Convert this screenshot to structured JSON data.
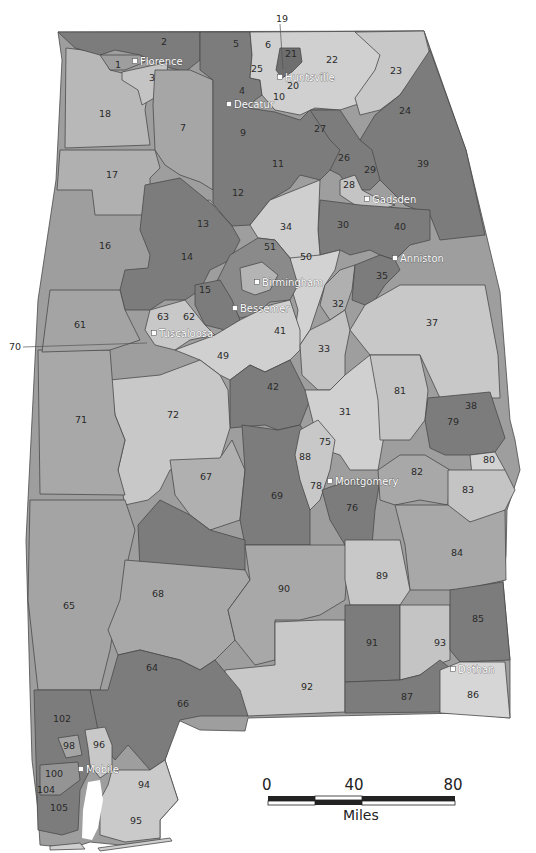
{
  "map": {
    "subject": "Alabama State House Districts",
    "colors": {
      "dark": "#7c7c7c",
      "medium": "#9e9e9e",
      "light": "#c4c4c4",
      "lighter": "#d6d6d6",
      "border": "#4a4a4a",
      "background": "#ffffff"
    },
    "cities": [
      {
        "name": "Florence",
        "x": 135,
        "y": 61
      },
      {
        "name": "Huntsville",
        "x": 280,
        "y": 77
      },
      {
        "name": "Decatur",
        "x": 229,
        "y": 104
      },
      {
        "name": "Gadsden",
        "x": 367,
        "y": 199
      },
      {
        "name": "Anniston",
        "x": 395,
        "y": 258
      },
      {
        "name": "Birmingham",
        "x": 257,
        "y": 282
      },
      {
        "name": "Bessemer",
        "x": 235,
        "y": 308
      },
      {
        "name": "Tuscaloosa",
        "x": 154,
        "y": 333
      },
      {
        "name": "Montgomery",
        "x": 330,
        "y": 481
      },
      {
        "name": "Dothan",
        "x": 453,
        "y": 669
      },
      {
        "name": "Mobile",
        "x": 81,
        "y": 769
      }
    ],
    "districts": [
      {
        "n": "1",
        "x": 118,
        "y": 65
      },
      {
        "n": "2",
        "x": 164,
        "y": 42
      },
      {
        "n": "3",
        "x": 152,
        "y": 78
      },
      {
        "n": "4",
        "x": 242,
        "y": 91
      },
      {
        "n": "5",
        "x": 236,
        "y": 44
      },
      {
        "n": "6",
        "x": 268,
        "y": 45
      },
      {
        "n": "7",
        "x": 183,
        "y": 128
      },
      {
        "n": "9",
        "x": 243,
        "y": 133
      },
      {
        "n": "10",
        "x": 279,
        "y": 97
      },
      {
        "n": "11",
        "x": 278,
        "y": 164
      },
      {
        "n": "12",
        "x": 238,
        "y": 193
      },
      {
        "n": "13",
        "x": 203,
        "y": 224
      },
      {
        "n": "14",
        "x": 187,
        "y": 257
      },
      {
        "n": "15",
        "x": 205,
        "y": 290
      },
      {
        "n": "16",
        "x": 105,
        "y": 246
      },
      {
        "n": "17",
        "x": 112,
        "y": 175
      },
      {
        "n": "18",
        "x": 105,
        "y": 114
      },
      {
        "n": "20",
        "x": 293,
        "y": 86
      },
      {
        "n": "21",
        "x": 291,
        "y": 54
      },
      {
        "n": "22",
        "x": 332,
        "y": 60
      },
      {
        "n": "23",
        "x": 396,
        "y": 71
      },
      {
        "n": "24",
        "x": 405,
        "y": 111
      },
      {
        "n": "25",
        "x": 257,
        "y": 69
      },
      {
        "n": "26",
        "x": 344,
        "y": 158
      },
      {
        "n": "27",
        "x": 320,
        "y": 129
      },
      {
        "n": "28",
        "x": 349,
        "y": 185
      },
      {
        "n": "29",
        "x": 370,
        "y": 170
      },
      {
        "n": "30",
        "x": 343,
        "y": 225
      },
      {
        "n": "31",
        "x": 345,
        "y": 412
      },
      {
        "n": "32",
        "x": 338,
        "y": 304
      },
      {
        "n": "33",
        "x": 324,
        "y": 349
      },
      {
        "n": "34",
        "x": 286,
        "y": 227
      },
      {
        "n": "35",
        "x": 382,
        "y": 276
      },
      {
        "n": "37",
        "x": 432,
        "y": 323
      },
      {
        "n": "38",
        "x": 471,
        "y": 406
      },
      {
        "n": "39",
        "x": 423,
        "y": 164
      },
      {
        "n": "40",
        "x": 400,
        "y": 227
      },
      {
        "n": "41",
        "x": 280,
        "y": 331
      },
      {
        "n": "42",
        "x": 273,
        "y": 387
      },
      {
        "n": "49",
        "x": 223,
        "y": 356
      },
      {
        "n": "50",
        "x": 306,
        "y": 257
      },
      {
        "n": "51",
        "x": 270,
        "y": 247
      },
      {
        "n": "61",
        "x": 80,
        "y": 325
      },
      {
        "n": "62",
        "x": 189,
        "y": 317
      },
      {
        "n": "63",
        "x": 163,
        "y": 317
      },
      {
        "n": "64",
        "x": 152,
        "y": 668
      },
      {
        "n": "65",
        "x": 69,
        "y": 606
      },
      {
        "n": "66",
        "x": 183,
        "y": 704
      },
      {
        "n": "67",
        "x": 206,
        "y": 477
      },
      {
        "n": "68",
        "x": 158,
        "y": 594
      },
      {
        "n": "69",
        "x": 277,
        "y": 496
      },
      {
        "n": "71",
        "x": 81,
        "y": 420
      },
      {
        "n": "72",
        "x": 173,
        "y": 415
      },
      {
        "n": "75",
        "x": 325,
        "y": 442
      },
      {
        "n": "76",
        "x": 352,
        "y": 508
      },
      {
        "n": "78",
        "x": 316,
        "y": 486
      },
      {
        "n": "79",
        "x": 453,
        "y": 422
      },
      {
        "n": "80",
        "x": 489,
        "y": 460
      },
      {
        "n": "81",
        "x": 400,
        "y": 391
      },
      {
        "n": "82",
        "x": 417,
        "y": 472
      },
      {
        "n": "83",
        "x": 468,
        "y": 490
      },
      {
        "n": "84",
        "x": 457,
        "y": 553
      },
      {
        "n": "85",
        "x": 478,
        "y": 619
      },
      {
        "n": "86",
        "x": 473,
        "y": 695
      },
      {
        "n": "87",
        "x": 407,
        "y": 697
      },
      {
        "n": "88",
        "x": 305,
        "y": 457
      },
      {
        "n": "89",
        "x": 382,
        "y": 576
      },
      {
        "n": "90",
        "x": 284,
        "y": 589
      },
      {
        "n": "91",
        "x": 372,
        "y": 643
      },
      {
        "n": "92",
        "x": 307,
        "y": 687
      },
      {
        "n": "93",
        "x": 440,
        "y": 643
      },
      {
        "n": "94",
        "x": 144,
        "y": 785
      },
      {
        "n": "95",
        "x": 136,
        "y": 821
      },
      {
        "n": "96",
        "x": 99,
        "y": 745
      },
      {
        "n": "98",
        "x": 69,
        "y": 746
      },
      {
        "n": "100",
        "x": 54,
        "y": 774
      },
      {
        "n": "102",
        "x": 62,
        "y": 719
      },
      {
        "n": "104",
        "x": 46,
        "y": 790
      },
      {
        "n": "105",
        "x": 59,
        "y": 808
      }
    ],
    "callouts": [
      {
        "n": "19",
        "label_x": 276,
        "label_y": 19,
        "to_x": 283,
        "to_y": 69
      },
      {
        "n": "70",
        "label_x": 9,
        "label_y": 347,
        "to_x": 147,
        "to_y": 343
      }
    ]
  },
  "scale_bar": {
    "ticks": [
      "0",
      "40",
      "80"
    ],
    "unit": "Miles"
  }
}
